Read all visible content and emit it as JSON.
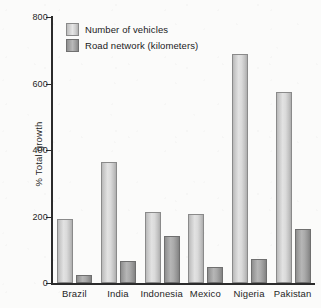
{
  "chart_data": {
    "type": "bar",
    "title": "",
    "subtitle": "",
    "xlabel": "",
    "ylabel": "% Total growth",
    "ylim": [
      0,
      800
    ],
    "yticks": [
      0,
      200,
      400,
      600,
      800
    ],
    "ytick_labels": [
      "0",
      "200",
      "400",
      "600",
      "800"
    ],
    "grid": false,
    "legend_position": "upper-left-inside",
    "categories": [
      "Brazil",
      "India",
      "Indonesia",
      "Mexico",
      "Nigeria",
      "Pakistan"
    ],
    "series": [
      {
        "name": "Number of vehicles",
        "color": "#dcdcdc",
        "values": [
          192,
          365,
          215,
          208,
          690,
          573
        ]
      },
      {
        "name": "Road network (kilometers)",
        "color": "#ababab",
        "values": [
          25,
          65,
          140,
          48,
          73,
          162
        ]
      }
    ]
  },
  "axis": {
    "y_title": "% Total growth"
  },
  "legend": {
    "items": [
      {
        "label": "Number of vehicles"
      },
      {
        "label": "Road network (kilometers)"
      }
    ]
  }
}
